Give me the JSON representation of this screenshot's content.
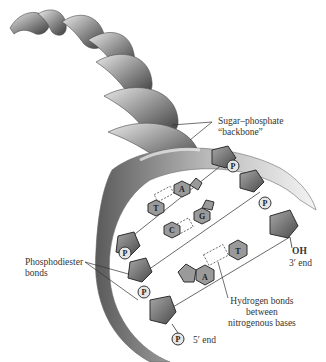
{
  "labels": {
    "backbone": [
      "Sugar–phosphate",
      "“backbone”"
    ],
    "phosphodiester": [
      "Phosphodiester",
      "bonds"
    ],
    "hydrogen": [
      "Hydrogen bonds",
      "between",
      "nitrogenous bases"
    ],
    "oh": "OH",
    "three_prime": "3′ end",
    "five_prime": "5′ end"
  },
  "bases": {
    "left_strand": [
      "T",
      "C",
      "A"
    ],
    "right_strand": [
      "A",
      "G",
      "T"
    ]
  },
  "phosphate_label": "P",
  "colors": {
    "sugar": "#6f6f6f",
    "sugar_dark": "#3a3a3a",
    "base": "#9a9a9a",
    "phosphate": "#e6e6e6",
    "helix_light": "#cfcfcf",
    "helix_dark": "#555555",
    "text": "#333333"
  }
}
